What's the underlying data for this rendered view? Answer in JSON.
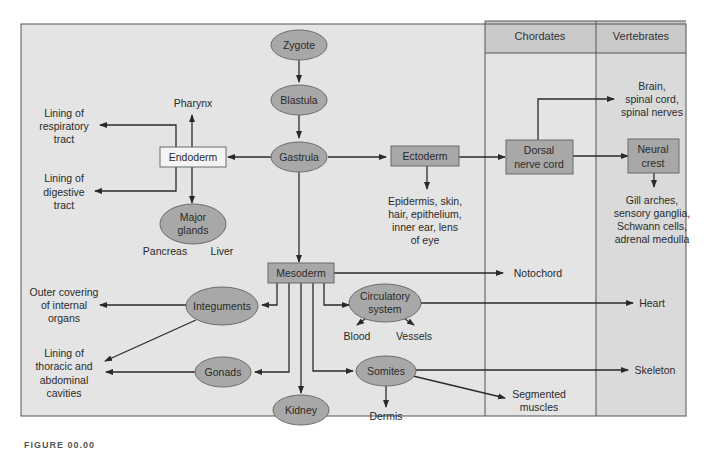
{
  "colors": {
    "panel_bg": "#e4e4e4",
    "vertebrates_bg": "#d9d9d9",
    "header_bg": "#c9c9c9",
    "node_fill": "#a8a8a8",
    "node_stroke": "#6b6b6b",
    "endoderm_fill": "#f4f4f4",
    "line": "#2a2a2a"
  },
  "columns": {
    "chordates": "Chordates",
    "vertebrates": "Vertebrates"
  },
  "nodes": {
    "zygote": "Zygote",
    "blastula": "Blastula",
    "gastrula": "Gastrula",
    "endoderm": "Endoderm",
    "ectoderm": "Ectoderm",
    "mesoderm": "Mesoderm",
    "major_glands": [
      "Major",
      "glands"
    ],
    "dorsal_nerve_cord": [
      "Dorsal",
      "nerve cord"
    ],
    "neural_crest": [
      "Neural",
      "crest"
    ],
    "integuments": "Integuments",
    "gonads": "Gonads",
    "kidney": "Kidney",
    "circulatory_system": [
      "Circulatory",
      "system"
    ],
    "somites": "Somites"
  },
  "labels": {
    "pharynx": "Pharynx",
    "lining_respiratory": [
      "Lining of",
      "respiratory",
      "tract"
    ],
    "lining_digestive": [
      "Lining of",
      "digestive",
      "tract"
    ],
    "pancreas": "Pancreas",
    "liver": "Liver",
    "ectoderm_products": [
      "Epidermis, skin,",
      "hair, epithelium,",
      "inner ear, lens",
      "of eye"
    ],
    "brain": [
      "Brain,",
      "spinal cord,",
      "spinal nerves"
    ],
    "neural_crest_products": [
      "Gill arches,",
      "sensory ganglia,",
      "Schwann cells,",
      "adrenal medulla"
    ],
    "notochord": "Notochord",
    "heart": "Heart",
    "skeleton": "Skeleton",
    "outer_covering": [
      "Outer covering",
      "of internal",
      "organs"
    ],
    "lining_thoracic": [
      "Lining of",
      "thoracic and",
      "abdominal",
      "cavities"
    ],
    "blood": "Blood",
    "vessels": "Vessels",
    "dermis": "Dermis",
    "segmented_muscles": [
      "Segmented",
      "muscles"
    ]
  },
  "caption": "FIGURE 00.00"
}
